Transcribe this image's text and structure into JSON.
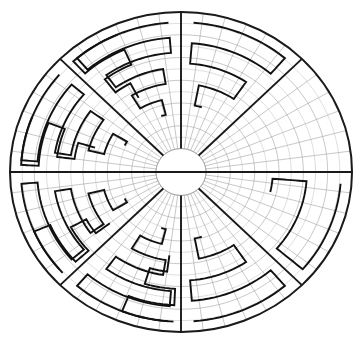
{
  "figure": {
    "type": "polar-maze-diagram",
    "canvas": {
      "width": 360,
      "height": 344,
      "background": "#ffffff"
    },
    "center": {
      "cx": 181,
      "cy": 172
    },
    "radii": {
      "outer_rx": 171,
      "outer_ry": 160,
      "inner_hub": 25
    },
    "colors": {
      "outline": "#1a1a1a",
      "grid": "#9a9a9a",
      "grid_faint": "#c2c2c2",
      "meander": "#111111",
      "background": "#ffffff"
    },
    "strokes": {
      "outline": 2.0,
      "grid": 0.55,
      "spoke": 1.9,
      "meander": 1.9
    },
    "grid": {
      "rings": 12,
      "radial_lines": 48,
      "ring_start_fraction": 0.147,
      "grid_on": true
    },
    "spokes": {
      "count": 8,
      "angles_deg": [
        0,
        45,
        90,
        135,
        180,
        225,
        270,
        315
      ],
      "hub_radius": 25
    },
    "sectors": [
      {
        "name": "sector-n-left",
        "start_deg": 90,
        "end_deg": 135,
        "pattern": "meander-spiral",
        "turns": 3,
        "orientation": "ccw"
      },
      {
        "name": "sector-nw",
        "start_deg": 135,
        "end_deg": 180,
        "pattern": "meander-spiral",
        "turns": 3,
        "orientation": "ccw"
      },
      {
        "name": "sector-w",
        "start_deg": 180,
        "end_deg": 225,
        "pattern": "meander-spiral",
        "turns": 3,
        "orientation": "cw"
      },
      {
        "name": "sector-sw",
        "start_deg": 225,
        "end_deg": 270,
        "pattern": "meander-spiral",
        "turns": 3,
        "orientation": "cw"
      },
      {
        "name": "sector-s-right",
        "start_deg": 270,
        "end_deg": 315,
        "pattern": "meander-spiral",
        "turns": 2,
        "orientation": "ccw"
      },
      {
        "name": "sector-se",
        "start_deg": 315,
        "end_deg": 360,
        "pattern": "meander-partial",
        "turns": 1,
        "orientation": "cw"
      },
      {
        "name": "sector-ne",
        "start_deg": 0,
        "end_deg": 45,
        "pattern": "empty",
        "turns": 0,
        "orientation": "none"
      },
      {
        "name": "sector-n-right",
        "start_deg": 45,
        "end_deg": 90,
        "pattern": "meander-spiral",
        "turns": 2,
        "orientation": "cw"
      }
    ],
    "diameter_lines": [
      {
        "name": "horizontal-diameter",
        "angle_deg": 0
      }
    ]
  },
  "chart_data": {
    "type": "polar-grid",
    "rings": 12,
    "sectors": 48,
    "spokes": 8,
    "radial_ticks": [
      25,
      37,
      49,
      61,
      73,
      86,
      98,
      110,
      122,
      134,
      147,
      159,
      171
    ],
    "angular_ticks_deg": [
      0,
      45,
      90,
      135,
      180,
      225,
      270,
      315
    ],
    "xlabel": "",
    "ylabel": "",
    "legend": []
  }
}
